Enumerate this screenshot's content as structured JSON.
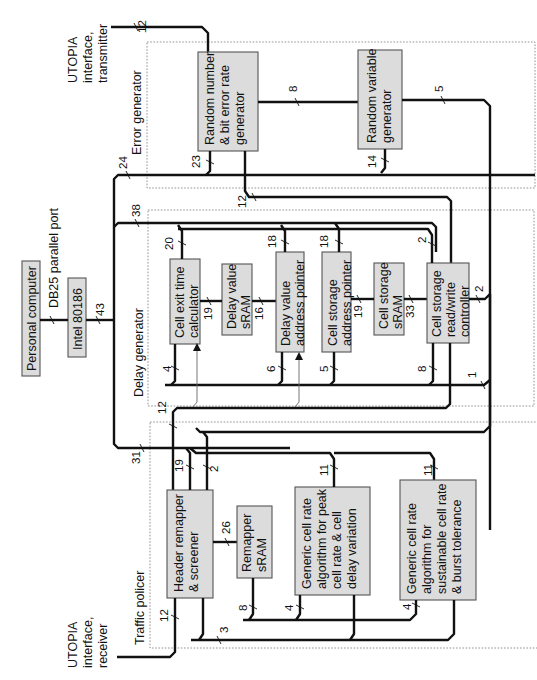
{
  "regions": {
    "error_generator": "Error generator",
    "delay_generator": "Delay generator",
    "traffic_policer": "Traffic policer"
  },
  "external": {
    "personal_computer": "Personal computer",
    "db25_port": "DB25 parallel port",
    "intel_80186": "Intel 80186",
    "utopia_tx": [
      "UTOPIA",
      "interface,",
      "transmitter"
    ],
    "utopia_rx": [
      "UTOPIA",
      "interface,",
      "receiver"
    ]
  },
  "blocks": {
    "random_number": [
      "Random number",
      "& bit error rate",
      "generator"
    ],
    "random_variable": [
      "Random variable",
      "generator"
    ],
    "cell_exit_time": [
      "Cell exit time",
      "calculator"
    ],
    "delay_value_sram": [
      "Delay value",
      "sRAM"
    ],
    "delay_value_addr": [
      "Delay value",
      "address pointer"
    ],
    "cell_storage_addr": [
      "Cell storage",
      "address pointer"
    ],
    "cell_storage_sram": [
      "Cell storage",
      "sRAM"
    ],
    "cell_storage_rw": [
      "Cell storage",
      "read/write",
      "controller"
    ],
    "header_remapper": [
      "Header remapper",
      "& screener"
    ],
    "remapper_sram": [
      "Remapper",
      "sRAM"
    ],
    "gcra_peak": [
      "Generic cell rate",
      "algorithm for peak",
      "cell rate & cell",
      "delay variation"
    ],
    "gcra_sustainable": [
      "Generic cell rate",
      "algorithm for",
      "sustainable cell rate",
      "& burst tolerance"
    ]
  },
  "bus_widths": {
    "utopia_tx": "12",
    "rng_to_rvg": "8",
    "rvg_out": "5",
    "rng_bus": "23",
    "rvg_bus": "14",
    "pc_bus": "24",
    "rng_12": "12",
    "delay_bus": "38",
    "pc_link": "43",
    "cet_top": "20",
    "dvap_top": "18",
    "csap_top": "18",
    "csrw_top": "2",
    "cet_dvs": "19",
    "dvs_dvap": "16",
    "csap_css": "19",
    "css_csrw": "33",
    "csrw_right": "2",
    "cet_bot": "4",
    "dvap_bot": "6",
    "csap_bot": "5",
    "csrw_bot": "8",
    "ctrl_1": "1",
    "hr_12": "12",
    "hr_31": "31",
    "hr_19": "19",
    "hr_2": "2",
    "hr_26": "26",
    "gcra_peak_top": "11",
    "gcra_sust_top": "11",
    "utopia_rx": "12",
    "rs_8": "8",
    "bot_3": "3",
    "gcra_peak_bot": "4",
    "gcra_sust_bot": "4"
  }
}
